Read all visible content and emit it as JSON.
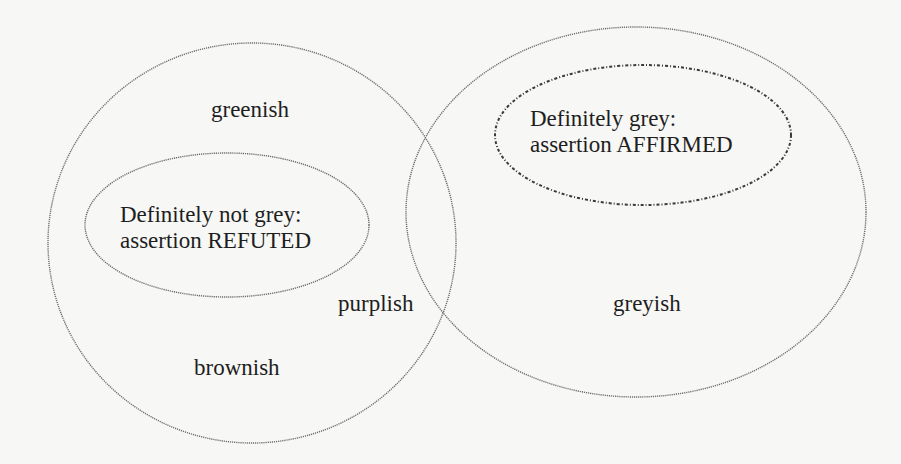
{
  "diagram": {
    "type": "venn",
    "sets": [
      {
        "id": "left",
        "labels": [
          "greenish",
          "brownish"
        ],
        "inner_region": {
          "line1": "Definitely not grey:",
          "line2": "assertion REFUTED"
        }
      },
      {
        "id": "right",
        "labels": [
          "greyish"
        ],
        "inner_region": {
          "line1": "Definitely grey:",
          "line2": "assertion AFFIRMED"
        }
      }
    ],
    "overlap_label": "purplish"
  },
  "labels": {
    "greenish": "greenish",
    "brownish": "brownish",
    "purplish": "purplish",
    "greyish": "greyish",
    "refuted_line1": "Definitely not grey:",
    "refuted_line2": "assertion REFUTED",
    "affirmed_line1": "Definitely grey:",
    "affirmed_line2": "assertion AFFIRMED"
  },
  "colors": {
    "background": "#f7f7f5",
    "line": "#6d6d6d",
    "text": "#1e1e1e"
  }
}
